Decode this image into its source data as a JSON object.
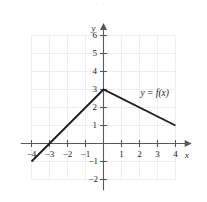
{
  "figure": {
    "background_color": "#ffffff",
    "axis_color": "#58595b",
    "grid_color": "#eeeef1",
    "curve_color": "#231f20",
    "text_color": "#231f20",
    "top_bleed_text": "· · ·"
  },
  "axes": {
    "x_axis_label": "x",
    "y_axis_label": "y",
    "x_tick_labels": [
      "−4",
      "−3",
      "−2",
      "−1",
      "1",
      "2",
      "3",
      "4"
    ],
    "y_tick_labels": [
      "−2",
      "−1",
      "1",
      "2",
      "3",
      "4",
      "5",
      "6"
    ]
  },
  "annotations": {
    "curve_label": "y = f(x)"
  },
  "chart_data": {
    "type": "line",
    "title": "",
    "xlabel": "x",
    "ylabel": "y",
    "xlim": [
      -4.6,
      4.9
    ],
    "ylim": [
      -2.6,
      6.7
    ],
    "grid": true,
    "grid_x_range": [
      -4,
      4
    ],
    "grid_y_range": [
      -2,
      6
    ],
    "legend": "none",
    "x_ticks": [
      -4,
      -3,
      -2,
      -1,
      1,
      2,
      3,
      4
    ],
    "y_ticks": [
      -2,
      -1,
      1,
      2,
      3,
      4,
      5,
      6
    ],
    "series": [
      {
        "name": "y = f(x)",
        "x": [
          -4,
          -3,
          0,
          4
        ],
        "y": [
          -1,
          0,
          3,
          1
        ],
        "piecewise": true,
        "vertices": [
          {
            "x": -4,
            "y": -1,
            "role": "left-endpoint"
          },
          {
            "x": -3,
            "y": 0,
            "role": "x-intercept"
          },
          {
            "x": 0,
            "y": 3,
            "role": "peak-y-intercept"
          },
          {
            "x": 4,
            "y": 1,
            "role": "right-endpoint"
          }
        ]
      }
    ]
  }
}
